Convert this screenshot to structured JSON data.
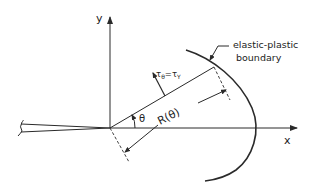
{
  "diagram": {
    "type": "crack-tip elastic-plastic boundary schematic",
    "axes": {
      "x_label": "x",
      "y_label": "y"
    },
    "labels": {
      "boundary_line1": "elastic-plastic",
      "boundary_line2": "boundary",
      "stress_condition": "τθ=τY",
      "stress_main": "τ",
      "stress_sub1": "θ",
      "stress_eq": "=τ",
      "stress_sub2": "Y",
      "angle": "θ",
      "radius": "R(θ)"
    },
    "colors": {
      "line": "#2a2a2a",
      "background": "#ffffff"
    }
  }
}
